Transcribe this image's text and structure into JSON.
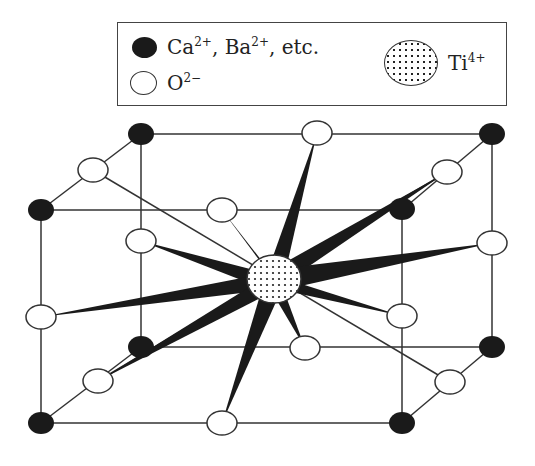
{
  "legend": {
    "items": [
      {
        "symbol": "filled-black-circle",
        "label": "Ca",
        "charge1": "2+",
        "sep": ", Ba",
        "charge2": "2+",
        "tail": ", etc."
      },
      {
        "symbol": "open-circle",
        "label": "O",
        "charge": "2−"
      },
      {
        "symbol": "dotted-circle",
        "label": "Ti",
        "charge": "4+"
      }
    ]
  },
  "diagram": {
    "center_ion": "Ti4+",
    "colors": {
      "line": "#333333",
      "bond": "#1a1a1a",
      "a_site": "#1a1a1a",
      "oxygen_fill": "#ffffff"
    }
  }
}
